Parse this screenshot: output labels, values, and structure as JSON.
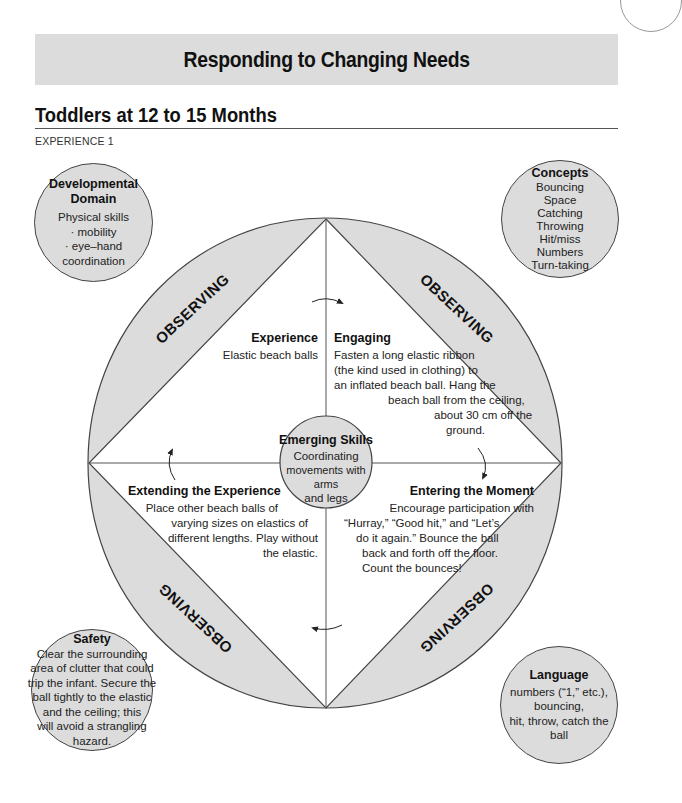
{
  "header": {
    "banner_title": "Responding to Changing Needs",
    "subtitle": "Toddlers at 12 to 15 Months",
    "experience_label": "EXPERIENCE 1"
  },
  "diagram": {
    "observing_label": "OBSERVING",
    "quadrants": {
      "experience": {
        "title": "Experience",
        "body": "Elastic beach balls"
      },
      "engaging": {
        "title": "Engaging",
        "lines": [
          "Fasten a long elastic ribbon",
          "(the kind used in clothing) to",
          "an inflated beach ball. Hang the",
          "beach ball from the ceiling,",
          "about 30 cm off the",
          "ground."
        ]
      },
      "extending": {
        "title": "Extending the Experience",
        "lines": [
          "Place other beach balls of",
          "varying sizes on elastics of",
          "different lengths. Play without",
          "the elastic."
        ]
      },
      "entering": {
        "title": "Entering the Moment",
        "lines": [
          "Encourage participation with",
          "“Hurray,” “Good hit,” and “Let’s",
          "do it again.” Bounce the ball",
          "back and forth off the floor.",
          "Count the bounces!"
        ]
      }
    },
    "center": {
      "title": "Emerging Skills",
      "lines": [
        "Coordinating",
        "movements with arms",
        "and legs"
      ]
    }
  },
  "bubbles": {
    "developmental_domain": {
      "title_lines": [
        "Developmental",
        "Domain"
      ],
      "lines": [
        "Physical skills",
        "· mobility",
        "· eye–hand",
        "coordination"
      ]
    },
    "concepts": {
      "title": "Concepts",
      "lines": [
        "Bouncing",
        "Space",
        "Catching",
        "Throwing",
        "Hit/miss",
        "Numbers",
        "Turn-taking"
      ]
    },
    "safety": {
      "title": "Safety",
      "lines": [
        "Clear the surrounding",
        "area of clutter that could",
        "trip the infant. Secure the",
        "ball tightly to the elastic",
        "and the ceiling; this",
        "will avoid a strangling",
        "hazard."
      ]
    },
    "language": {
      "title": "Language",
      "lines": [
        "numbers (“1,” etc.),",
        "bouncing,",
        "hit, throw, catch the",
        "ball"
      ]
    }
  },
  "colors": {
    "fill": "#dcdcdc",
    "stroke": "#444444"
  }
}
